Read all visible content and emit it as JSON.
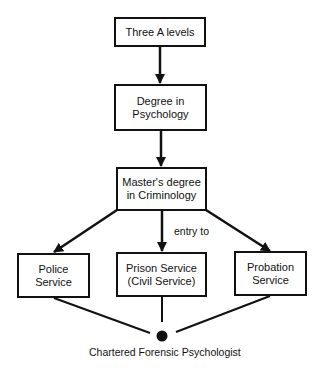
{
  "diagram": {
    "nodes": [
      {
        "id": "three-a-levels",
        "label": "Three A levels"
      },
      {
        "id": "degree-psychology",
        "label": "Degree in\nPsychology"
      },
      {
        "id": "masters-criminology",
        "label": "Master's degree\nin Criminology"
      },
      {
        "id": "police-service",
        "label": "Police\nService"
      },
      {
        "id": "prison-service",
        "label": "Prison Service\n(Civil Service)"
      },
      {
        "id": "probation-service",
        "label": "Probation\nService"
      }
    ],
    "edge_label": "entry to",
    "endpoint_label": "Chartered Forensic Psychologist",
    "edges": [
      {
        "from": "three-a-levels",
        "to": "degree-psychology",
        "arrow": true
      },
      {
        "from": "degree-psychology",
        "to": "masters-criminology",
        "arrow": true
      },
      {
        "from": "masters-criminology",
        "to": "police-service",
        "arrow": true
      },
      {
        "from": "masters-criminology",
        "to": "prison-service",
        "arrow": true,
        "label": "entry to"
      },
      {
        "from": "masters-criminology",
        "to": "probation-service",
        "arrow": true
      },
      {
        "from": "police-service",
        "to": "chartered-forensic-psychologist",
        "arrow": false
      },
      {
        "from": "prison-service",
        "to": "chartered-forensic-psychologist",
        "arrow": false
      },
      {
        "from": "probation-service",
        "to": "chartered-forensic-psychologist",
        "arrow": false
      }
    ],
    "colors": {
      "line": "#111111",
      "background": "#ffffff"
    }
  }
}
